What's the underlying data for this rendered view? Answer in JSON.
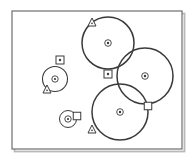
{
  "figure": {
    "title": "",
    "background_color": "#ffffff",
    "ink_color": "#3a3a3a",
    "frame_color": "#6e6e6e",
    "width": 194,
    "height": 161
  },
  "frame": {
    "x": 12,
    "y": 11,
    "width": 170,
    "height": 138,
    "stroke_width": 1.2,
    "shadow_color": "#b9b9b9"
  },
  "chart_data": {
    "type": "scatter",
    "title": "",
    "xlabel": "",
    "ylabel": "",
    "xlim": [
      0,
      194
    ],
    "ylim": [
      0,
      161
    ],
    "grid": false,
    "legend": "none",
    "coverage_circles": [
      {
        "id": "C1",
        "label": "top-left-coverage-circle",
        "cx": 108,
        "cy": 43,
        "r": 26,
        "stroke_width": 1.5
      },
      {
        "id": "C2",
        "label": "right-coverage-circle",
        "cx": 145,
        "cy": 76,
        "r": 28,
        "stroke_width": 1.5
      },
      {
        "id": "C3",
        "label": "bottom-coverage-circle",
        "cx": 120,
        "cy": 112,
        "r": 28,
        "stroke_width": 1.5
      }
    ],
    "node_circles": [
      {
        "id": "N1",
        "label": "left-node-circle",
        "cx": 55,
        "cy": 79,
        "r": 12.5,
        "inner_r": 3.2,
        "dot_r": 1.1,
        "stroke_width": 1.1
      },
      {
        "id": "N2",
        "label": "lower-left-node-circle",
        "cx": 68,
        "cy": 119,
        "r": 8.5,
        "inner_r": 3.2,
        "dot_r": 1.1,
        "stroke_width": 1.0
      }
    ],
    "center_markers": [
      {
        "id": "M1",
        "label": "top-left-circle-center",
        "cx": 108,
        "cy": 43,
        "outer_r": 3.3,
        "dot_r": 1.2
      },
      {
        "id": "M2",
        "label": "right-circle-center",
        "cx": 145,
        "cy": 76,
        "outer_r": 3.3,
        "dot_r": 1.2
      },
      {
        "id": "M3",
        "label": "bottom-circle-center",
        "cx": 120,
        "cy": 112,
        "outer_r": 3.3,
        "dot_r": 1.2
      }
    ],
    "squares": [
      {
        "id": "S1",
        "label": "free-square-marker",
        "cx": 60,
        "cy": 60,
        "size": 8,
        "dot_r": 1.2
      },
      {
        "id": "S2",
        "label": "upper-intersection-square",
        "cx": 108,
        "cy": 74,
        "size": 8,
        "dot_r": 1.2
      },
      {
        "id": "S3",
        "label": "node-adjacent-square",
        "cx": 77,
        "cy": 116,
        "size": 7.5,
        "dot_r": 0
      },
      {
        "id": "S4",
        "label": "lower-intersection-square",
        "cx": 148,
        "cy": 106,
        "size": 7.5,
        "dot_r": 0
      }
    ],
    "triangles": [
      {
        "id": "T1",
        "label": "top-triangle-marker",
        "cx": 92,
        "cy": 22,
        "size": 8
      },
      {
        "id": "T2",
        "label": "left-triangle-marker",
        "cx": 47,
        "cy": 89,
        "size": 8
      },
      {
        "id": "T3",
        "label": "bottom-triangle-marker",
        "cx": 92,
        "cy": 129,
        "size": 8
      }
    ]
  }
}
